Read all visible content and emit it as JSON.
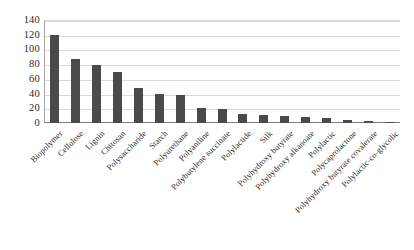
{
  "chart_data": {
    "type": "bar",
    "title": "",
    "xlabel": "",
    "ylabel": "",
    "ylim": [
      0,
      140
    ],
    "ytick_step": 20,
    "yticks": [
      "140",
      "120",
      "100",
      "80",
      "60",
      "40",
      "20",
      "0"
    ],
    "grid": true,
    "legend": "none",
    "bar_color": "#4a4a4a",
    "gridline_color": "#d9d9d9",
    "axis_color": "#7f7f7f",
    "categories": [
      "Biopolymer",
      "Cellulose",
      "Lignin",
      "Chitosan",
      "Polysaccharide",
      "Starch",
      "Polyurethane",
      "Polyaniline",
      "Polybutylene succinate",
      "Polylactide",
      "Silk",
      "Polyhydroxy butyrate",
      "Polyhydroxy alkanoate",
      "Polylactic",
      "Polycaprolactone",
      "Polyhydroxy butyrate covalerate",
      "Polylactic-co-glycolic"
    ],
    "values": [
      120,
      87,
      79,
      69,
      47,
      40,
      38,
      21,
      19,
      12,
      11,
      10,
      8,
      7,
      4,
      3,
      2
    ]
  }
}
